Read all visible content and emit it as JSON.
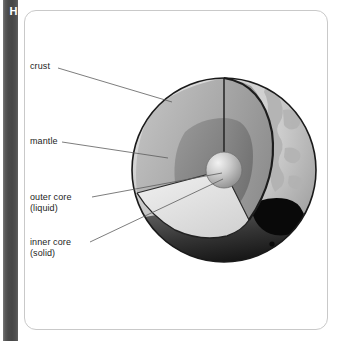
{
  "figure": {
    "letter": "H"
  },
  "labels": {
    "crust": "crust",
    "mantle": "mantle",
    "outer_core": "outer core\n(liquid)",
    "inner_core": "inner core\n(solid)"
  },
  "diagram": {
    "type": "cross-section-cutaway-sphere",
    "layers": [
      {
        "name": "crust",
        "state": "",
        "color": "#b4b4b4"
      },
      {
        "name": "mantle",
        "state": "",
        "color": "#a9a9a9"
      },
      {
        "name": "outer core",
        "state": "liquid",
        "color": "#8e8e8e"
      },
      {
        "name": "inner core",
        "state": "solid",
        "color": "#c3c3c3"
      }
    ],
    "surface_features": [
      {
        "name": "continents-asia",
        "color": "#b0b0b0"
      },
      {
        "name": "continent-australia",
        "color": "#0a0a0a"
      }
    ],
    "shadow_color": "#141414",
    "outline_color": "#1a1a1a"
  },
  "colors": {
    "spine": "#4b4b4b",
    "spine_text": "#ffffff",
    "panel_border": "#c9c9c9",
    "panel_bg": "#ffffff",
    "label_text": "#1c1c1c",
    "leader_line": "#5c5c5c"
  }
}
